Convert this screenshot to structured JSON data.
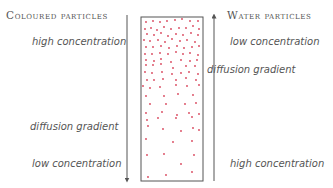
{
  "left": {
    "title": "Coloured particles",
    "top_label": "high concentration",
    "middle_label": "diffusion gradient",
    "bottom_label": "low concentration",
    "arrow_direction": "down"
  },
  "right": {
    "title": "Water particles",
    "top_label": "low concentration",
    "middle_label": "diffusion gradient",
    "bottom_label": "high concentration",
    "arrow_direction": "up"
  },
  "colors": {
    "particle": "#d9435a",
    "line": "#555555",
    "text": "#555555"
  },
  "particles": [
    [
      146,
      22
    ],
    [
      153,
      21
    ],
    [
      160,
      22
    ],
    [
      167,
      21
    ],
    [
      175,
      20
    ],
    [
      182,
      19
    ],
    [
      190,
      21
    ],
    [
      198,
      21
    ],
    [
      145,
      29
    ],
    [
      151,
      28
    ],
    [
      157,
      30
    ],
    [
      164,
      27
    ],
    [
      171,
      29
    ],
    [
      179,
      28
    ],
    [
      186,
      28
    ],
    [
      193,
      26
    ],
    [
      199,
      29
    ],
    [
      147,
      34
    ],
    [
      154,
      35
    ],
    [
      161,
      33
    ],
    [
      168,
      36
    ],
    [
      176,
      34
    ],
    [
      183,
      35
    ],
    [
      191,
      33
    ],
    [
      198,
      35
    ],
    [
      144,
      40
    ],
    [
      150,
      41
    ],
    [
      158,
      40
    ],
    [
      165,
      42
    ],
    [
      172,
      39
    ],
    [
      180,
      41
    ],
    [
      187,
      40
    ],
    [
      195,
      42
    ],
    [
      146,
      47
    ],
    [
      153,
      47
    ],
    [
      161,
      46
    ],
    [
      169,
      48
    ],
    [
      177,
      46
    ],
    [
      184,
      48
    ],
    [
      192,
      47
    ],
    [
      199,
      46
    ],
    [
      145,
      54
    ],
    [
      152,
      54
    ],
    [
      160,
      53
    ],
    [
      168,
      54
    ],
    [
      176,
      52
    ],
    [
      183,
      54
    ],
    [
      190,
      53
    ],
    [
      198,
      55
    ],
    [
      146,
      60
    ],
    [
      154,
      61
    ],
    [
      161,
      59
    ],
    [
      171,
      62
    ],
    [
      181,
      60
    ],
    [
      190,
      61
    ],
    [
      197,
      60
    ],
    [
      146,
      65
    ],
    [
      153,
      65
    ],
    [
      161,
      64
    ],
    [
      173,
      68
    ],
    [
      186,
      66
    ],
    [
      195,
      66
    ],
    [
      145,
      72
    ],
    [
      152,
      73
    ],
    [
      162,
      72
    ],
    [
      172,
      74
    ],
    [
      181,
      73
    ],
    [
      189,
      72
    ],
    [
      198,
      74
    ],
    [
      147,
      80
    ],
    [
      154,
      80
    ],
    [
      163,
      79
    ],
    [
      176,
      80
    ],
    [
      186,
      78
    ],
    [
      196,
      80
    ],
    [
      143,
      86
    ],
    [
      150,
      88
    ],
    [
      160,
      87
    ],
    [
      176,
      85
    ],
    [
      187,
      86
    ],
    [
      199,
      85
    ],
    [
      146,
      96
    ],
    [
      164,
      96
    ],
    [
      178,
      94
    ],
    [
      193,
      95
    ],
    [
      150,
      104
    ],
    [
      166,
      104
    ],
    [
      185,
      104
    ],
    [
      196,
      103
    ],
    [
      146,
      113
    ],
    [
      162,
      112
    ],
    [
      177,
      115
    ],
    [
      189,
      113
    ],
    [
      199,
      114
    ],
    [
      147,
      120
    ],
    [
      158,
      118
    ],
    [
      176,
      118
    ],
    [
      192,
      117
    ],
    [
      148,
      126
    ],
    [
      163,
      129
    ],
    [
      181,
      131
    ],
    [
      193,
      128
    ],
    [
      199,
      130
    ],
    [
      146,
      139
    ],
    [
      173,
      142
    ],
    [
      192,
      141
    ],
    [
      147,
      155
    ],
    [
      164,
      154
    ],
    [
      194,
      155
    ],
    [
      181,
      164
    ],
    [
      148,
      177
    ],
    [
      166,
      175
    ],
    [
      192,
      172
    ]
  ]
}
